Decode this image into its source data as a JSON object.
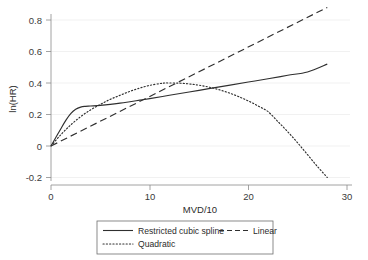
{
  "chart_data": {
    "type": "line",
    "title": "",
    "xlabel": "MVD/10",
    "ylabel": "ln(HR)",
    "xlim": [
      0,
      30
    ],
    "ylim": [
      -0.2,
      0.92
    ],
    "xticks": [
      0,
      10,
      20,
      30
    ],
    "xtick_labels": [
      "0",
      "10",
      "20",
      "30"
    ],
    "yticks": [
      -0.2,
      0,
      0.2,
      0.4,
      0.6,
      0.8
    ],
    "ytick_labels": [
      "-0.2",
      "0",
      "0.2",
      "0.4",
      "0.6",
      "0.8"
    ],
    "grid": "horizontal",
    "legend_position": "below",
    "series": [
      {
        "name": "Restricted cubic spline",
        "style": "solid",
        "x": [
          0,
          0.5,
          1,
          1.5,
          2,
          2.5,
          3,
          3.5,
          4,
          5,
          6,
          7,
          8,
          9,
          10,
          12,
          14,
          16,
          18,
          20,
          22,
          24,
          26,
          28
        ],
        "y": [
          0.0,
          0.055,
          0.11,
          0.163,
          0.206,
          0.233,
          0.247,
          0.252,
          0.254,
          0.258,
          0.264,
          0.272,
          0.281,
          0.291,
          0.301,
          0.322,
          0.343,
          0.364,
          0.385,
          0.406,
          0.427,
          0.449,
          0.47,
          0.52
        ]
      },
      {
        "name": "Linear",
        "style": "dashed",
        "x": [
          0,
          28
        ],
        "y": [
          0.0,
          0.88
        ]
      },
      {
        "name": "Quadratic",
        "style": "dotted",
        "x": [
          0,
          1,
          2,
          3,
          4,
          5,
          6,
          7,
          8,
          9,
          10,
          11,
          11.5,
          12,
          13,
          14,
          15,
          16,
          17,
          18,
          19,
          20,
          21,
          22,
          23,
          24,
          25,
          26,
          27,
          28
        ],
        "y": [
          0.0,
          0.072,
          0.134,
          0.186,
          0.229,
          0.264,
          0.296,
          0.322,
          0.347,
          0.368,
          0.385,
          0.396,
          0.4,
          0.4,
          0.399,
          0.394,
          0.386,
          0.374,
          0.358,
          0.338,
          0.314,
          0.286,
          0.254,
          0.218,
          0.155,
          0.09,
          0.02,
          -0.055,
          -0.13,
          -0.2
        ]
      }
    ]
  },
  "legend": {
    "entries": [
      {
        "label": "Restricted cubic spline",
        "style": "solid"
      },
      {
        "label": "Linear",
        "style": "dashed"
      },
      {
        "label": "Quadratic",
        "style": "dotted"
      }
    ]
  },
  "colors": {
    "curve": "#2f2f2f",
    "axis": "#8c8c8c",
    "grid": "#e8e8e8",
    "background": "#ffffff"
  }
}
